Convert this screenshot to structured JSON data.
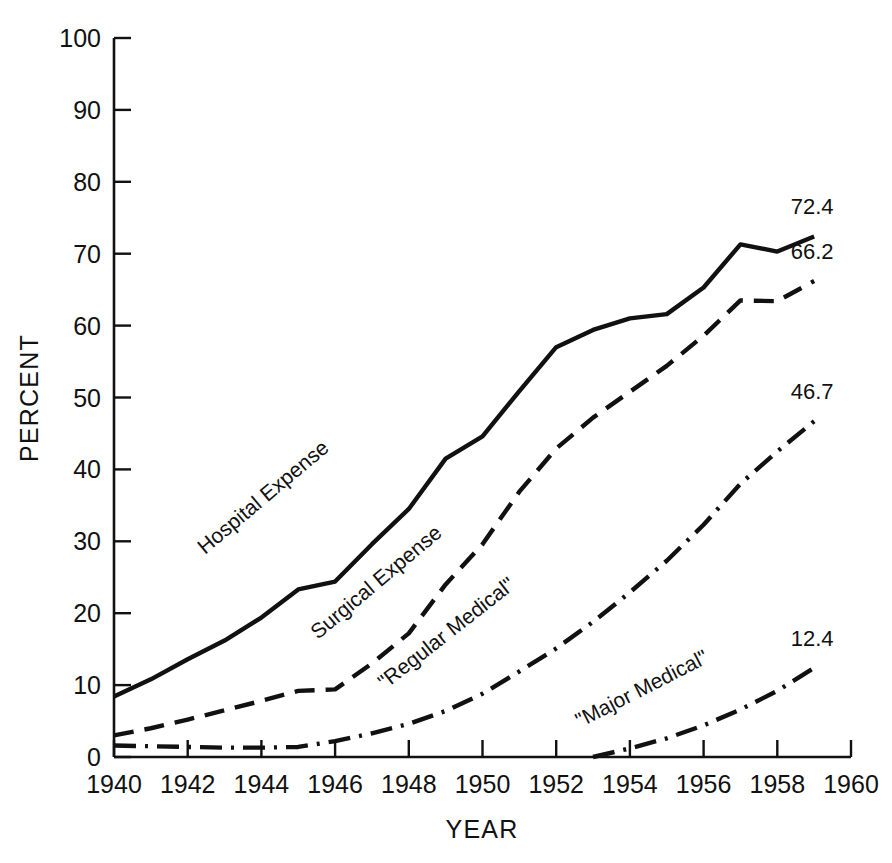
{
  "chart_data": {
    "type": "line",
    "title": "",
    "xlabel": "YEAR",
    "ylabel": "PERCENT",
    "xlim": [
      1940,
      1960
    ],
    "ylim": [
      0,
      100
    ],
    "grid": false,
    "legend_position": "inline-along-curves",
    "x_ticks": [
      1940,
      1942,
      1944,
      1946,
      1948,
      1950,
      1952,
      1954,
      1956,
      1958,
      1960
    ],
    "x_tick_labels": [
      "1940",
      "1942",
      "1944",
      "1946",
      "1948",
      "1950",
      "1952",
      "1954",
      "1956",
      "1958",
      "1960"
    ],
    "y_ticks": [
      0,
      10,
      20,
      30,
      40,
      50,
      60,
      70,
      80,
      90,
      100
    ],
    "y_tick_labels": [
      "0",
      "10",
      "20",
      "30",
      "40",
      "50",
      "60",
      "70",
      "80",
      "90",
      "100"
    ],
    "series": [
      {
        "name": "Hospital Expense",
        "label": "Hospital Expense",
        "line_style": "solid",
        "end_value_label": "72.4",
        "x": [
          1940,
          1941,
          1942,
          1943,
          1944,
          1945,
          1946,
          1947,
          1948,
          1949,
          1950,
          1951,
          1952,
          1953,
          1954,
          1955,
          1956,
          1957,
          1958,
          1959
        ],
        "values": [
          8.4,
          10.8,
          13.6,
          16.2,
          19.4,
          23.3,
          24.4,
          29.6,
          34.5,
          41.5,
          44.6,
          50.9,
          57.0,
          59.4,
          61.0,
          61.6,
          65.3,
          71.3,
          70.3,
          72.4
        ]
      },
      {
        "name": "Surgical Expense",
        "label": "Surgical Expense",
        "line_style": "dashed",
        "end_value_label": "66.2",
        "x": [
          1940,
          1941,
          1942,
          1943,
          1944,
          1945,
          1946,
          1947,
          1948,
          1949,
          1950,
          1951,
          1952,
          1953,
          1954,
          1955,
          1956,
          1957,
          1958,
          1959
        ],
        "values": [
          3.0,
          4.0,
          5.2,
          6.5,
          7.8,
          9.2,
          9.4,
          13.0,
          17.2,
          24.0,
          29.6,
          36.9,
          42.9,
          47.2,
          50.8,
          54.4,
          58.6,
          63.5,
          63.4,
          66.2
        ]
      },
      {
        "name": "Regular Medical",
        "label": "\"Regular Medical\"",
        "line_style": "dash-dot",
        "end_value_label": "46.7",
        "x": [
          1940,
          1941,
          1942,
          1943,
          1944,
          1945,
          1946,
          1947,
          1948,
          1949,
          1950,
          1951,
          1952,
          1953,
          1954,
          1955,
          1956,
          1957,
          1958,
          1959
        ],
        "values": [
          1.6,
          1.5,
          1.4,
          1.3,
          1.3,
          1.4,
          2.2,
          3.3,
          4.6,
          6.4,
          8.8,
          11.9,
          15.1,
          18.8,
          22.9,
          27.3,
          32.3,
          38.0,
          42.5,
          46.7
        ]
      },
      {
        "name": "Major Medical",
        "label": "\"Major Medical\"",
        "line_style": "dash-dot",
        "end_value_label": "12.4",
        "x": [
          1953,
          1954,
          1955,
          1956,
          1957,
          1958,
          1959
        ],
        "values": [
          0.0,
          1.2,
          2.6,
          4.4,
          6.6,
          9.2,
          12.4
        ]
      }
    ],
    "annotations": [
      {
        "text": "72.4",
        "series": "Hospital Expense",
        "position": "above-right-end"
      },
      {
        "text": "66.2",
        "series": "Surgical Expense",
        "position": "above-right-end"
      },
      {
        "text": "46.7",
        "series": "Regular Medical",
        "position": "above-right-end"
      },
      {
        "text": "12.4",
        "series": "Major Medical",
        "position": "above-right-end"
      }
    ],
    "colors": {
      "line": "#111111",
      "axis": "#111111",
      "background": "#ffffff"
    }
  }
}
